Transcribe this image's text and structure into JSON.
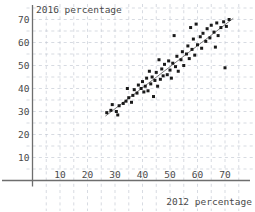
{
  "chart_data": {
    "type": "scatter",
    "title": "",
    "xlabel": "2012 percentage",
    "ylabel": "2016 percentage",
    "xlim": [
      0,
      78
    ],
    "ylim": [
      0,
      75
    ],
    "xticks": [
      10,
      20,
      30,
      40,
      50,
      60,
      70
    ],
    "yticks": [
      10,
      20,
      30,
      40,
      50,
      60,
      70
    ],
    "grid": true,
    "grid_style": "dashed",
    "legend": "none",
    "point_color": "#1a1a1a",
    "line_color": "#7b7b7b",
    "trendline": {
      "label": "fit line",
      "x_start": 26.5,
      "y_start": 28.0,
      "x_end": 73.0,
      "y_end": 70.5
    },
    "points": [
      {
        "x": 27.0,
        "y": 29.5
      },
      {
        "x": 28.5,
        "y": 30.5
      },
      {
        "x": 30.5,
        "y": 30.0
      },
      {
        "x": 31.5,
        "y": 32.5
      },
      {
        "x": 33.0,
        "y": 33.5
      },
      {
        "x": 34.0,
        "y": 34.5
      },
      {
        "x": 35.0,
        "y": 36.0
      },
      {
        "x": 36.5,
        "y": 37.0
      },
      {
        "x": 37.0,
        "y": 39.5
      },
      {
        "x": 38.0,
        "y": 38.0
      },
      {
        "x": 38.5,
        "y": 41.5
      },
      {
        "x": 39.5,
        "y": 40.0
      },
      {
        "x": 40.0,
        "y": 43.0
      },
      {
        "x": 40.5,
        "y": 38.5
      },
      {
        "x": 41.0,
        "y": 41.0
      },
      {
        "x": 41.5,
        "y": 44.5
      },
      {
        "x": 42.0,
        "y": 39.0
      },
      {
        "x": 43.0,
        "y": 42.0
      },
      {
        "x": 43.5,
        "y": 45.0
      },
      {
        "x": 44.5,
        "y": 43.5
      },
      {
        "x": 45.0,
        "y": 47.0
      },
      {
        "x": 45.5,
        "y": 41.0
      },
      {
        "x": 46.5,
        "y": 44.0
      },
      {
        "x": 47.0,
        "y": 48.5
      },
      {
        "x": 47.5,
        "y": 45.5
      },
      {
        "x": 48.0,
        "y": 50.5
      },
      {
        "x": 49.0,
        "y": 46.0
      },
      {
        "x": 49.5,
        "y": 52.0
      },
      {
        "x": 50.0,
        "y": 48.0
      },
      {
        "x": 50.5,
        "y": 44.5
      },
      {
        "x": 51.0,
        "y": 51.0
      },
      {
        "x": 52.0,
        "y": 49.5
      },
      {
        "x": 52.5,
        "y": 54.0
      },
      {
        "x": 53.0,
        "y": 47.5
      },
      {
        "x": 54.0,
        "y": 52.5
      },
      {
        "x": 54.5,
        "y": 56.0
      },
      {
        "x": 55.0,
        "y": 50.0
      },
      {
        "x": 56.0,
        "y": 55.0
      },
      {
        "x": 56.5,
        "y": 58.5
      },
      {
        "x": 57.0,
        "y": 53.0
      },
      {
        "x": 58.0,
        "y": 57.0
      },
      {
        "x": 58.5,
        "y": 61.5
      },
      {
        "x": 59.0,
        "y": 54.5
      },
      {
        "x": 60.0,
        "y": 59.0
      },
      {
        "x": 61.0,
        "y": 62.5
      },
      {
        "x": 61.5,
        "y": 57.5
      },
      {
        "x": 62.0,
        "y": 64.0
      },
      {
        "x": 63.0,
        "y": 60.5
      },
      {
        "x": 63.5,
        "y": 66.0
      },
      {
        "x": 64.5,
        "y": 62.0
      },
      {
        "x": 65.0,
        "y": 67.5
      },
      {
        "x": 66.0,
        "y": 64.5
      },
      {
        "x": 67.0,
        "y": 68.5
      },
      {
        "x": 67.5,
        "y": 63.0
      },
      {
        "x": 68.5,
        "y": 66.5
      },
      {
        "x": 69.5,
        "y": 69.0
      },
      {
        "x": 70.5,
        "y": 67.0
      },
      {
        "x": 71.5,
        "y": 70.0
      },
      {
        "x": 51.5,
        "y": 63.0
      },
      {
        "x": 44.0,
        "y": 36.5
      },
      {
        "x": 36.0,
        "y": 34.0
      },
      {
        "x": 70.0,
        "y": 49.0
      },
      {
        "x": 31.0,
        "y": 28.5
      },
      {
        "x": 29.0,
        "y": 33.0
      },
      {
        "x": 46.0,
        "y": 52.5
      },
      {
        "x": 57.5,
        "y": 66.5
      },
      {
        "x": 59.5,
        "y": 68.0
      },
      {
        "x": 42.5,
        "y": 47.5
      },
      {
        "x": 34.5,
        "y": 40.0
      },
      {
        "x": 66.5,
        "y": 58.0
      }
    ]
  },
  "axes": {
    "x_axis_name": "x-axis",
    "y_axis_name": "y-axis"
  }
}
